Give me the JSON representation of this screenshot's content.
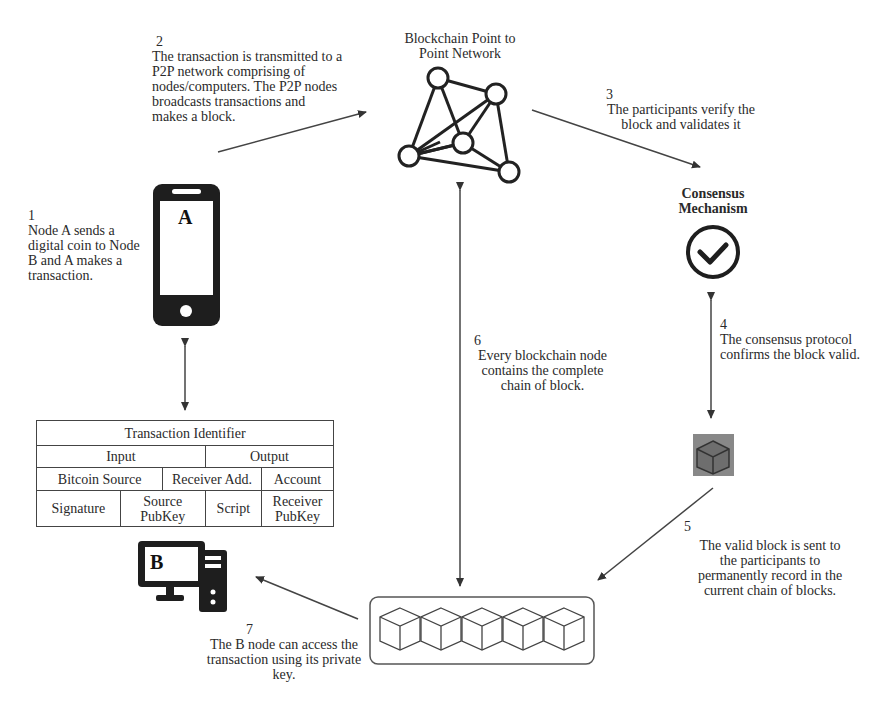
{
  "diagram": {
    "network": {
      "label_line1": "Blockchain Point to",
      "label_line2": "Point Network"
    },
    "consensus": {
      "label_line1": "Consensus",
      "label_line2": "Mechanism"
    },
    "node_a_label": "A",
    "node_b_label": "B",
    "steps": [
      {
        "num": "1",
        "lines": [
          "Node A sends a",
          "digital coin to Node",
          "B and A makes a",
          "transaction."
        ]
      },
      {
        "num": "2",
        "lines": [
          "The transaction is transmitted to a",
          "P2P network comprising of",
          "nodes/computers. The P2P nodes",
          "broadcasts transactions and",
          "makes a block."
        ]
      },
      {
        "num": "3",
        "lines": [
          "The participants verify the",
          "block and validates it"
        ]
      },
      {
        "num": "4",
        "lines": [
          "The consensus protocol",
          "confirms the block valid."
        ]
      },
      {
        "num": "5",
        "lines": [
          "The valid block is sent to",
          "the participants to",
          "permanently record in the",
          "current chain of blocks."
        ]
      },
      {
        "num": "6",
        "lines": [
          "Every blockchain node",
          "contains the complete",
          "chain of block."
        ]
      },
      {
        "num": "7",
        "lines": [
          "The B node can access the",
          "transaction using its private",
          "key."
        ]
      }
    ],
    "transaction_table": {
      "header": "Transaction Identifier",
      "row2": [
        "Input",
        "Output"
      ],
      "row3": [
        "Bitcoin Source",
        "Receiver Add.",
        "Account"
      ],
      "row4": [
        "Signature",
        "Source PubKey",
        "Script",
        "Receiver PubKey"
      ]
    },
    "chain_block_count": 5
  }
}
